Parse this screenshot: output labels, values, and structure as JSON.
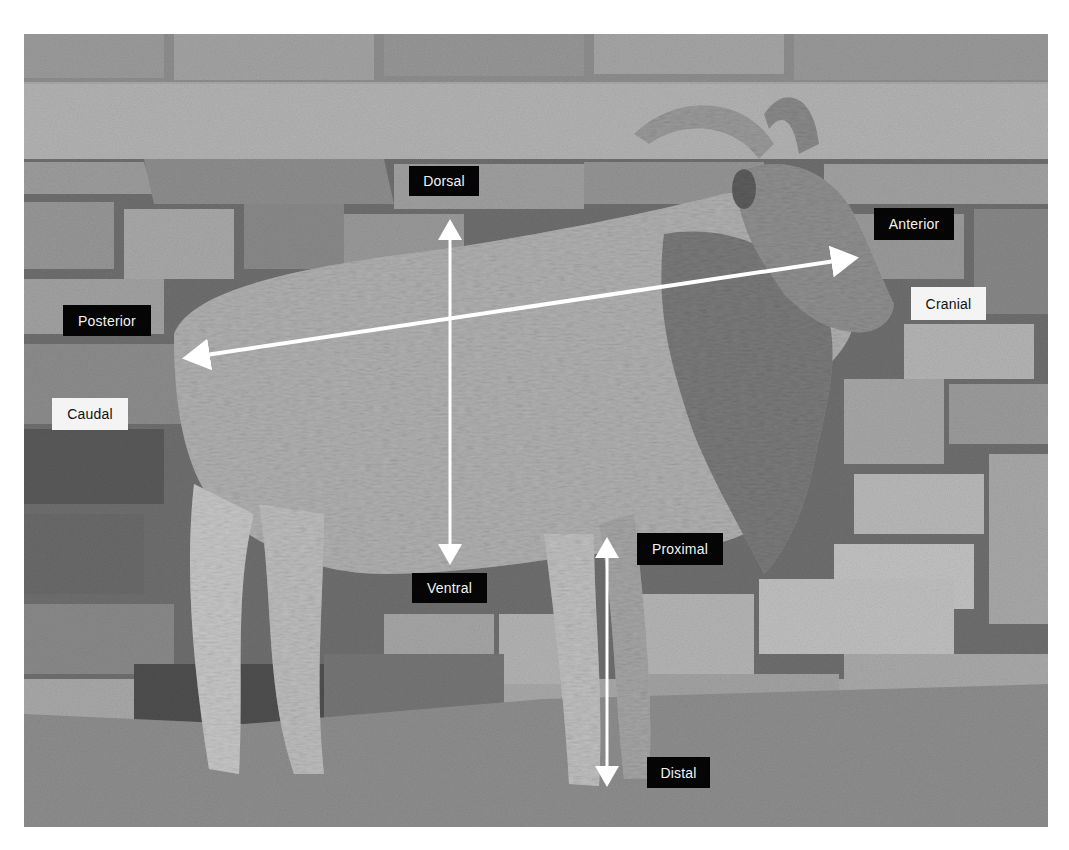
{
  "figure": {
    "style": "grayscale photograph with directional-term annotations",
    "labels": {
      "dorsal": "Dorsal",
      "ventral": "Ventral",
      "anterior": "Anterior",
      "posterior": "Posterior",
      "cranial": "Cranial",
      "caudal": "Caudal",
      "proximal": "Proximal",
      "distal": "Distal"
    },
    "arrows": [
      {
        "name": "dorsal-ventral-axis",
        "from": "Dorsal",
        "to": "Ventral",
        "orientation": "vertical",
        "heads": "both"
      },
      {
        "name": "anterior-posterior-axis",
        "from": "Anterior",
        "to": "Posterior",
        "orientation": "diagonal-horizontal",
        "heads": "both"
      },
      {
        "name": "proximal-distal-axis",
        "from": "Proximal",
        "to": "Distal",
        "orientation": "vertical",
        "heads": "both"
      }
    ],
    "colors": {
      "arrow": "#ffffff",
      "dark_label_bg": "#050505",
      "dark_label_text": "#f2f2f2",
      "light_label_bg": "#f4f4f4",
      "light_label_text": "#111111"
    }
  }
}
